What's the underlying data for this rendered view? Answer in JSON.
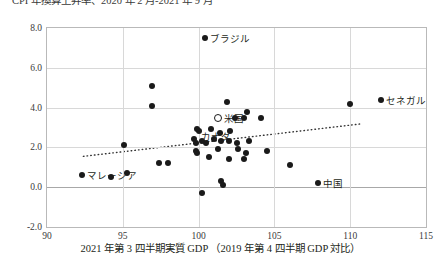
{
  "chart": {
    "title": "CPI 年換算上昇率、2020 年 2 月‐2021 年 9 月",
    "x_axis_title": "2021 年第 3 四半期実質 GDP （2019 年第 4 四半期 GDP 対比）"
  },
  "chart_data": {
    "type": "scatter",
    "title": "CPI 年換算上昇率、2020 年 2 月‐2021 年 9 月",
    "xlabel": "2021 年第 3 四半期実質 GDP （2019 年第 4 四半期 GDP 対比）",
    "ylabel": "",
    "xlim": [
      90,
      115
    ],
    "ylim": [
      -2.0,
      8.0
    ],
    "xticks": [
      "90",
      "95",
      "100",
      "105",
      "110",
      "115"
    ],
    "yticks": [
      "8.0",
      "6.0",
      "4.0",
      "2.0",
      "0.0",
      "-2.0"
    ],
    "grid": true,
    "legend": "none",
    "marker_styles": {
      "filled": "solid black circle",
      "highlight": "hollow black-outlined circle"
    },
    "series": [
      {
        "name": "各国",
        "marker": "filled",
        "points": [
          {
            "x": 100.4,
            "y": 7.5,
            "label": "ブラジル"
          },
          {
            "x": 112.0,
            "y": 4.4,
            "label": "セネガル"
          },
          {
            "x": 110.0,
            "y": 4.2,
            "label": ""
          },
          {
            "x": 96.9,
            "y": 5.1,
            "label": ""
          },
          {
            "x": 96.9,
            "y": 4.1,
            "label": ""
          },
          {
            "x": 101.9,
            "y": 4.3,
            "label": ""
          },
          {
            "x": 102.4,
            "y": 3.5,
            "label": ""
          },
          {
            "x": 103.0,
            "y": 3.5,
            "label": ""
          },
          {
            "x": 104.1,
            "y": 3.5,
            "label": ""
          },
          {
            "x": 103.2,
            "y": 3.8,
            "label": ""
          },
          {
            "x": 100.8,
            "y": 2.9,
            "label": ""
          },
          {
            "x": 101.4,
            "y": 2.7,
            "label": ""
          },
          {
            "x": 102.1,
            "y": 2.8,
            "label": ""
          },
          {
            "x": 100.0,
            "y": 2.8,
            "label": ""
          },
          {
            "x": 99.9,
            "y": 2.9,
            "label": ""
          },
          {
            "x": 101.0,
            "y": 2.4,
            "label": ""
          },
          {
            "x": 101.5,
            "y": 2.3,
            "label": ""
          },
          {
            "x": 102.0,
            "y": 2.3,
            "label": ""
          },
          {
            "x": 99.7,
            "y": 2.4,
            "label": ""
          },
          {
            "x": 100.2,
            "y": 2.3,
            "label": ""
          },
          {
            "x": 99.8,
            "y": 2.2,
            "label": "カナダ"
          },
          {
            "x": 100.5,
            "y": 2.2,
            "label": ""
          },
          {
            "x": 102.5,
            "y": 2.2,
            "label": ""
          },
          {
            "x": 103.3,
            "y": 2.3,
            "label": ""
          },
          {
            "x": 95.1,
            "y": 2.1,
            "label": ""
          },
          {
            "x": 99.8,
            "y": 1.8,
            "label": ""
          },
          {
            "x": 99.9,
            "y": 1.7,
            "label": ""
          },
          {
            "x": 101.3,
            "y": 1.9,
            "label": ""
          },
          {
            "x": 102.6,
            "y": 1.9,
            "label": ""
          },
          {
            "x": 103.1,
            "y": 1.7,
            "label": ""
          },
          {
            "x": 104.5,
            "y": 1.8,
            "label": ""
          },
          {
            "x": 100.7,
            "y": 1.5,
            "label": ""
          },
          {
            "x": 102.0,
            "y": 1.4,
            "label": ""
          },
          {
            "x": 103.0,
            "y": 1.4,
            "label": ""
          },
          {
            "x": 97.4,
            "y": 1.2,
            "label": ""
          },
          {
            "x": 98.0,
            "y": 1.2,
            "label": ""
          },
          {
            "x": 92.3,
            "y": 0.6,
            "label": "マレーシア"
          },
          {
            "x": 94.2,
            "y": 0.5,
            "label": ""
          },
          {
            "x": 95.3,
            "y": 0.7,
            "label": ""
          },
          {
            "x": 101.5,
            "y": 0.3,
            "label": ""
          },
          {
            "x": 101.6,
            "y": 0.1,
            "label": ""
          },
          {
            "x": 100.2,
            "y": -0.3,
            "label": ""
          },
          {
            "x": 107.9,
            "y": 0.2,
            "label": "中国"
          },
          {
            "x": 106.0,
            "y": 1.1,
            "label": ""
          }
        ]
      },
      {
        "name": "米国",
        "marker": "highlight",
        "points": [
          {
            "x": 101.3,
            "y": 3.5,
            "label": "米国"
          }
        ]
      }
    ],
    "trendline": {
      "style": "dotted",
      "x0": 92.4,
      "y0": 1.55,
      "x1": 110.7,
      "y1": 3.18
    },
    "annotations": [
      {
        "text": "ブラジル",
        "x": 100.4,
        "y": 7.5,
        "anchor": "right"
      },
      {
        "text": "セネガル",
        "x": 112.0,
        "y": 4.4,
        "anchor": "right"
      },
      {
        "text": "米国",
        "x": 101.3,
        "y": 3.5,
        "anchor": "right"
      },
      {
        "text": "カナダ",
        "x": 99.8,
        "y": 2.2,
        "anchor": "above-right"
      },
      {
        "text": "マレーシア",
        "x": 92.3,
        "y": 0.6,
        "anchor": "right"
      },
      {
        "text": "中国",
        "x": 107.9,
        "y": 0.2,
        "anchor": "right"
      }
    ]
  }
}
